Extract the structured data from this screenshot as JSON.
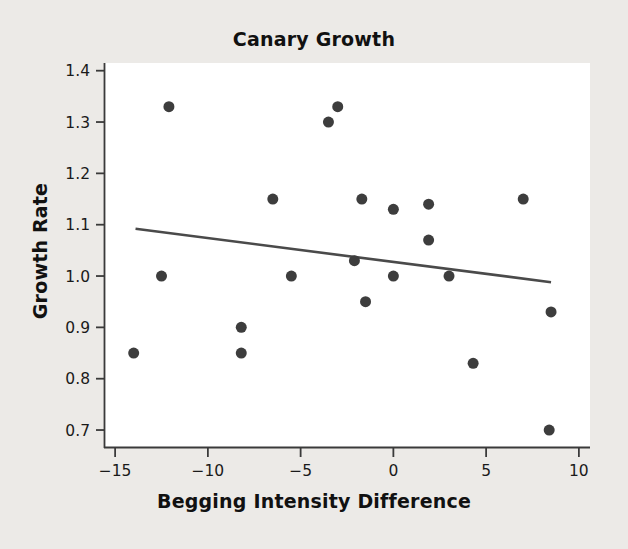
{
  "chart_data": {
    "type": "scatter",
    "title": "Canary Growth",
    "xlabel": "Begging Intensity Difference",
    "ylabel": "Growth Rate",
    "xlim": [
      -15.6,
      10.6
    ],
    "ylim": [
      0.665,
      1.415
    ],
    "xticks": [
      -15,
      -10,
      -5,
      0,
      5,
      10
    ],
    "xtick_labels": [
      "−15",
      "−10",
      "−5",
      "0",
      "5",
      "10"
    ],
    "yticks": [
      0.7,
      0.8,
      0.9,
      1.0,
      1.1,
      1.2,
      1.3,
      1.4
    ],
    "ytick_labels": [
      "0.7",
      "0.8",
      "0.9",
      "1.0",
      "1.1",
      "1.2",
      "1.3",
      "1.4"
    ],
    "grid": false,
    "legend": null,
    "marker_color": "#3d3d3d",
    "marker_size": 11,
    "line_color": "#4a4a4a",
    "plot_background": "#ffffff",
    "figure_background": "#eceae7",
    "points": [
      {
        "x": -14.0,
        "y": 0.85
      },
      {
        "x": -12.5,
        "y": 1.0
      },
      {
        "x": -12.1,
        "y": 1.33
      },
      {
        "x": -8.2,
        "y": 0.9
      },
      {
        "x": -8.2,
        "y": 0.85
      },
      {
        "x": -6.5,
        "y": 1.15
      },
      {
        "x": -5.5,
        "y": 1.0
      },
      {
        "x": -3.5,
        "y": 1.3
      },
      {
        "x": -3.0,
        "y": 1.33
      },
      {
        "x": -2.1,
        "y": 1.03
      },
      {
        "x": -1.7,
        "y": 1.15
      },
      {
        "x": -1.5,
        "y": 0.95
      },
      {
        "x": 0.0,
        "y": 1.13
      },
      {
        "x": 0.0,
        "y": 1.0
      },
      {
        "x": 1.9,
        "y": 1.14
      },
      {
        "x": 1.9,
        "y": 1.07
      },
      {
        "x": 3.0,
        "y": 1.0
      },
      {
        "x": 4.3,
        "y": 0.83
      },
      {
        "x": 7.0,
        "y": 1.15
      },
      {
        "x": 8.5,
        "y": 0.93
      },
      {
        "x": 8.4,
        "y": 0.7
      }
    ],
    "trendline": {
      "x_start": -13.9,
      "y_start": 1.092,
      "x_end": 8.5,
      "y_end": 0.988
    }
  }
}
